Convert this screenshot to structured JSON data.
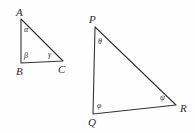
{
  "figure": {
    "background_color": "#fefefe",
    "stroke_color": "#333333",
    "label_color": "#2b2b2b",
    "width": 195,
    "height": 133
  },
  "triangles": [
    {
      "name": "triangle-abc",
      "vertices": [
        {
          "label": "A",
          "x": 21,
          "y": 19,
          "label_x": 16,
          "label_y": 7
        },
        {
          "label": "B",
          "x": 21,
          "y": 63,
          "label_x": 16,
          "label_y": 66
        },
        {
          "label": "C",
          "x": 63,
          "y": 61,
          "label_x": 58,
          "label_y": 64
        }
      ],
      "angles": [
        {
          "label": "α",
          "at": "A",
          "label_x": 24,
          "label_y": 26
        },
        {
          "label": "β",
          "at": "B",
          "label_x": 24,
          "label_y": 52
        },
        {
          "label": "γ",
          "at": "C",
          "label_x": 48,
          "label_y": 51
        }
      ]
    },
    {
      "name": "triangle-pqr",
      "vertices": [
        {
          "label": "P",
          "x": 95,
          "y": 27,
          "label_x": 89,
          "label_y": 14
        },
        {
          "label": "Q",
          "x": 93,
          "y": 114,
          "label_x": 88,
          "label_y": 117
        },
        {
          "label": "R",
          "x": 176,
          "y": 105,
          "label_x": 180,
          "label_y": 103
        }
      ],
      "angles": [
        {
          "label": "θ",
          "at": "P",
          "label_x": 98,
          "label_y": 38
        },
        {
          "label": "φ",
          "at": "Q",
          "label_x": 97,
          "label_y": 102
        },
        {
          "label": "ψ",
          "at": "R",
          "label_x": 160,
          "label_y": 94
        }
      ]
    }
  ]
}
